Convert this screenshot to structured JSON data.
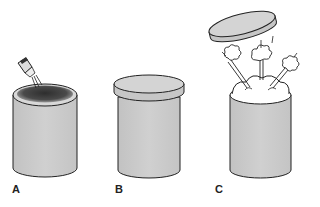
{
  "figure": {
    "panels": [
      {
        "id": "A",
        "label": "A",
        "description": "Open cylindrical container with dark liquid on top surface; a dropper dispenses drops into it"
      },
      {
        "id": "B",
        "label": "B",
        "description": "Cylindrical container closed with a lid"
      },
      {
        "id": "C",
        "label": "C",
        "description": "Lid flies off the container as contents bubble and burst out in puffs"
      }
    ],
    "colors": {
      "container_fill": "#c9c9c9",
      "outline": "#222222",
      "liquid": "#3a3a3a",
      "lid_fill": "#cfcfcf",
      "foam": "#ffffff"
    }
  }
}
